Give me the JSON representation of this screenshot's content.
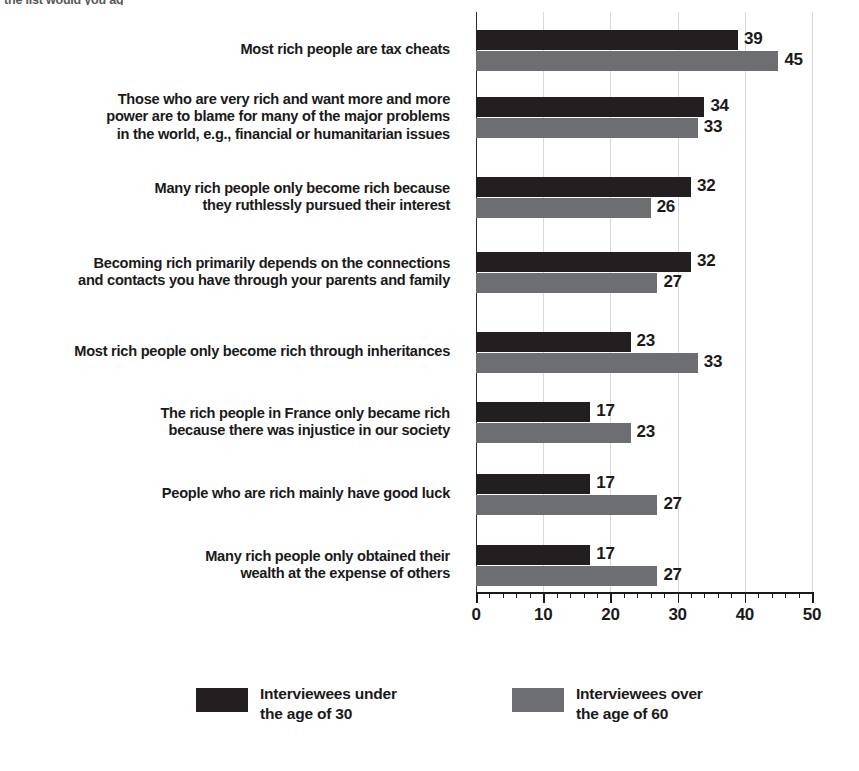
{
  "top_fragment": "the list would you ag",
  "chart_data": {
    "type": "bar",
    "orientation": "horizontal",
    "title": "",
    "xlabel": "",
    "ylabel": "",
    "xlim": [
      0,
      50
    ],
    "xticks": [
      0,
      10,
      20,
      30,
      40,
      50
    ],
    "xtick_labels": [
      "0",
      "10",
      "20",
      "30",
      "40",
      "50"
    ],
    "minor_tick_step": 2,
    "grid": true,
    "grid_axis": "x",
    "legend_position": "bottom",
    "categories": [
      "Most rich people are tax cheats",
      "Those who are very rich and want more and more\npower are to blame for many of the major problems\nin the world, e.g., financial or humanitarian issues",
      "Many rich people only become rich because\nthey ruthlessly pursued their interest",
      "Becoming rich primarily depends on the connections\nand contacts you have through your parents and family",
      "Most rich people only become rich through inheritances",
      "The rich people in France only became rich\nbecause there was injustice in our society",
      "People who are rich mainly have good luck",
      "Many rich people only obtained their\nwealth at the expense of others"
    ],
    "series": [
      {
        "name": "Interviewees under\nthe age of 30",
        "color": "#231f20",
        "values": [
          39,
          34,
          32,
          32,
          23,
          17,
          17,
          17
        ]
      },
      {
        "name": "Interviewees over\nthe age of 60",
        "color": "#6d6e71",
        "values": [
          45,
          33,
          26,
          27,
          33,
          23,
          27,
          27
        ]
      }
    ]
  },
  "legend": {
    "items": [
      {
        "label": "Interviewees under\nthe age of 30",
        "color": "#231f20"
      },
      {
        "label": "Interviewees over\nthe age of 60",
        "color": "#6d6e71"
      }
    ]
  }
}
